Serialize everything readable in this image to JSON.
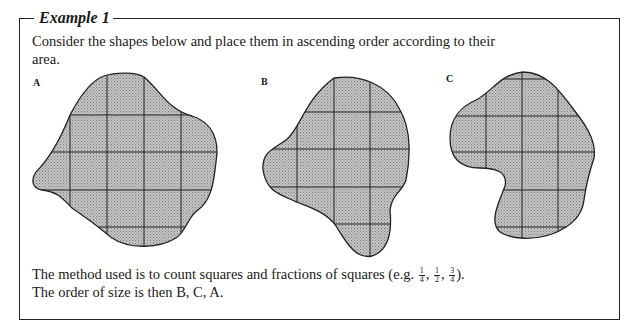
{
  "example": {
    "title": "Example 1",
    "intro": "Consider the shapes below and place them in ascending order according to their area.",
    "shapes": [
      {
        "label": "A"
      },
      {
        "label": "B"
      },
      {
        "label": "C"
      }
    ],
    "method_prefix": "The method used is to count squares and fractions of squares (e.g. ",
    "fractions": [
      {
        "num": "1",
        "den": "4"
      },
      {
        "num": "1",
        "den": "2"
      },
      {
        "num": "3",
        "den": "4"
      }
    ],
    "method_suffix": ").",
    "conclusion": "The order of size is then B, C, A."
  },
  "colors": {
    "fill": "#b5b5b5",
    "stroke": "#222222"
  }
}
